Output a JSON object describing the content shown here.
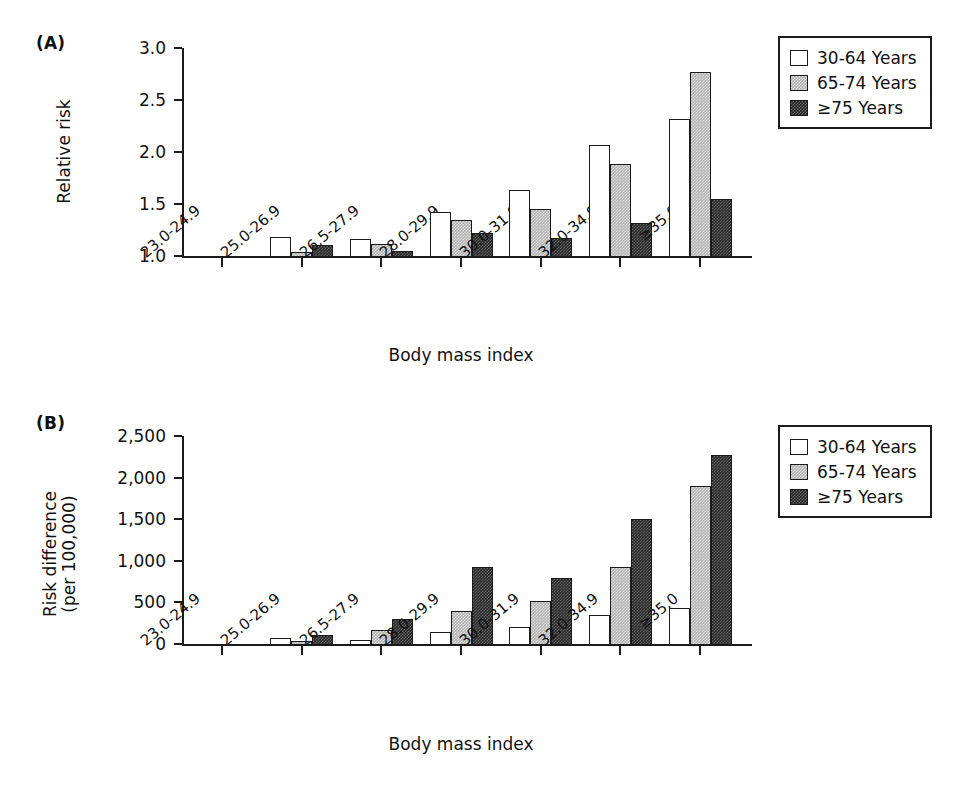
{
  "figure": {
    "panels": [
      {
        "letter": "(A)",
        "ylabel": "Relative risk",
        "xlabel": "Body mass index"
      },
      {
        "letter": "(B)",
        "ylabel_line1": "Risk difference",
        "ylabel_line2": "(per 100,000)",
        "xlabel": "Body mass index"
      }
    ],
    "legend": {
      "items": [
        {
          "label": "30-64 Years",
          "swatch": "white-open-square",
          "color": "#ffffff"
        },
        {
          "label": "65-74 Years",
          "swatch": "light-gray-square",
          "color": "#b3b3b3"
        },
        {
          "label": "≥75 Years",
          "swatch": "dark-gray-square",
          "color": "#2b2b2b"
        }
      ]
    }
  },
  "chart_data": [
    {
      "type": "bar",
      "panel": "A",
      "title": "",
      "xlabel": "Body mass index",
      "ylabel": "Relative risk",
      "categories": [
        "23.0-24.9",
        "25.0-26.9",
        "26.5-27.9",
        "28.0-29.9",
        "30.0-31.9",
        "32.0-34.9",
        "≥35.0"
      ],
      "yticks": [
        "1.0",
        "1.5",
        "2.0",
        "2.5",
        "3.0"
      ],
      "ylim": [
        1.0,
        3.0
      ],
      "grid": false,
      "legend_position": "top-right",
      "series": [
        {
          "name": "30-64 Years",
          "values": [
            1.0,
            1.18,
            1.16,
            1.42,
            1.63,
            2.07,
            2.32
          ]
        },
        {
          "name": "65-74 Years",
          "values": [
            1.0,
            1.04,
            1.12,
            1.35,
            1.45,
            1.88,
            2.77
          ]
        },
        {
          "name": "≥75 Years",
          "values": [
            1.0,
            1.11,
            1.05,
            1.22,
            1.17,
            1.32,
            1.55
          ]
        }
      ]
    },
    {
      "type": "bar",
      "panel": "B",
      "title": "",
      "xlabel": "Body mass index",
      "ylabel": "Risk difference (per 100,000)",
      "categories": [
        "23.0-24.9",
        "25.0-26.9",
        "26.5-27.9",
        "28.0-29.9",
        "30.0-31.9",
        "32.0-34.9",
        "≥35.0"
      ],
      "yticks": [
        "0",
        "500",
        "1,000",
        "1,500",
        "2,000",
        "2,500"
      ],
      "ylim": [
        0,
        2500
      ],
      "grid": false,
      "legend_position": "top-right",
      "series": [
        {
          "name": "30-64 Years",
          "values": [
            0,
            70,
            50,
            140,
            205,
            350,
            430
          ]
        },
        {
          "name": "65-74 Years",
          "values": [
            0,
            40,
            170,
            400,
            515,
            925,
            1900
          ]
        },
        {
          "name": "≥75 Years",
          "values": [
            0,
            110,
            300,
            930,
            790,
            1500,
            2270
          ]
        }
      ]
    }
  ]
}
